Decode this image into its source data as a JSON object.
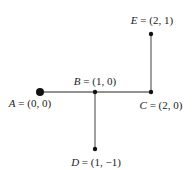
{
  "diagram": {
    "type": "graph",
    "colors": {
      "edge": "#6e6e6e",
      "node": "#111111",
      "label": "#222222"
    },
    "nodes": [
      {
        "id": "A",
        "name": "A",
        "coords": "(0, 0)",
        "px": 40,
        "py": 92,
        "r": 4,
        "label_x": 30,
        "label_y": 103
      },
      {
        "id": "B",
        "name": "B",
        "coords": "(1, 0)",
        "px": 95,
        "py": 92,
        "r": 2.2,
        "label_x": 95,
        "label_y": 81
      },
      {
        "id": "C",
        "name": "C",
        "coords": "(2, 0)",
        "px": 151,
        "py": 92,
        "r": 2.2,
        "label_x": 161,
        "label_y": 105
      },
      {
        "id": "D",
        "name": "D",
        "coords": "(1, −1)",
        "px": 95,
        "py": 149,
        "r": 2.2,
        "label_x": 96,
        "label_y": 162
      },
      {
        "id": "E",
        "name": "E",
        "coords": "(2, 1)",
        "px": 151,
        "py": 34,
        "r": 2.2,
        "label_x": 152,
        "label_y": 20
      }
    ],
    "edges": [
      {
        "from": "A",
        "to": "B"
      },
      {
        "from": "B",
        "to": "C"
      },
      {
        "from": "B",
        "to": "D"
      },
      {
        "from": "C",
        "to": "E"
      }
    ]
  },
  "labels": {
    "A": {
      "var": "A",
      "eq": " = (0, 0)"
    },
    "B": {
      "var": "B",
      "eq": " = (1, 0)"
    },
    "C": {
      "var": "C",
      "eq": " = (2, 0)"
    },
    "D": {
      "var": "D",
      "eq": " = (1, −1)"
    },
    "E": {
      "var": "E",
      "eq": " = (2, 1)"
    }
  }
}
